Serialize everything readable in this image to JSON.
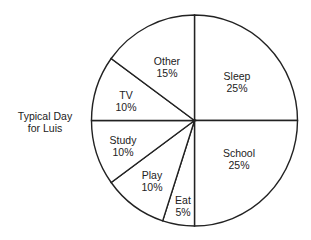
{
  "chart_data": {
    "type": "pie",
    "title": "Typical Day for Luis",
    "title_lines": [
      "Typical Day",
      "for Luis"
    ],
    "start_angle_deg": 0,
    "direction": "clockwise",
    "slices": [
      {
        "label": "Sleep",
        "value": 25,
        "pct_label": "25%",
        "lx": 237,
        "ly": 76
      },
      {
        "label": "School",
        "value": 25,
        "pct_label": "25%",
        "lx": 239,
        "ly": 153
      },
      {
        "label": "Eat",
        "value": 5,
        "pct_label": "5%",
        "lx": 183,
        "ly": 200
      },
      {
        "label": "Play",
        "value": 10,
        "pct_label": "10%",
        "lx": 152,
        "ly": 175
      },
      {
        "label": "Study",
        "value": 10,
        "pct_label": "10%",
        "lx": 123,
        "ly": 140
      },
      {
        "label": "TV",
        "value": 10,
        "pct_label": "10%",
        "lx": 126,
        "ly": 95
      },
      {
        "label": "Other",
        "value": 15,
        "pct_label": "15%",
        "lx": 167,
        "ly": 61
      }
    ],
    "colors": {
      "fill": "#ffffff",
      "stroke": "#222222",
      "text": "#222222"
    }
  }
}
